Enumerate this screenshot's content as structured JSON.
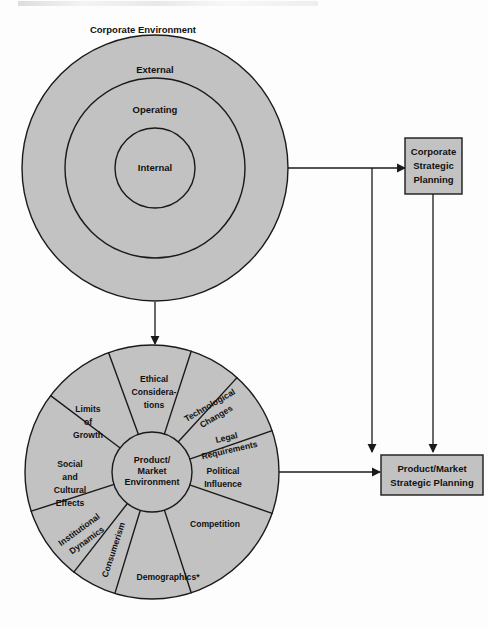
{
  "figure": {
    "title_top": "Corporate Environment",
    "footnote_marker": "*"
  },
  "corporate_environment": {
    "rings": [
      {
        "id": "external",
        "label": "External"
      },
      {
        "id": "operating",
        "label": "Operating"
      },
      {
        "id": "internal",
        "label": "Internal"
      }
    ]
  },
  "product_market_wheel": {
    "hub": {
      "line1": "Product/",
      "line2": "Market",
      "line3": "Environment"
    },
    "segments": [
      {
        "id": "ethical-considerations",
        "lines": [
          "Ethical",
          "Considera-",
          "tions"
        ]
      },
      {
        "id": "technological-changes",
        "lines": [
          "Technological",
          "Changes"
        ]
      },
      {
        "id": "legal-requirements",
        "lines": [
          "Legal",
          "Requirements"
        ]
      },
      {
        "id": "political-influence",
        "lines": [
          "Political",
          "Influence"
        ]
      },
      {
        "id": "competition",
        "lines": [
          "Competition"
        ]
      },
      {
        "id": "demographics",
        "lines": [
          "Demographics*"
        ]
      },
      {
        "id": "consumerism",
        "lines": [
          "Consumerism"
        ]
      },
      {
        "id": "institutional-dynamics",
        "lines": [
          "Institutional",
          "Dynamics"
        ]
      },
      {
        "id": "social-cultural-effects",
        "lines": [
          "Social",
          "and",
          "Cultural",
          "Effects"
        ]
      },
      {
        "id": "limits-of-growth",
        "lines": [
          "Limits",
          "of",
          "Growth"
        ]
      }
    ]
  },
  "boxes": {
    "corporate_strategic_planning": {
      "lines": [
        "Corporate",
        "Strategic",
        "Planning"
      ]
    },
    "product_market_strategic_planning": {
      "lines": [
        "Product/Market",
        "Strategic Planning"
      ]
    }
  },
  "colors": {
    "fill_gray": "#c2c2c2",
    "box_gray": "#c2c2c2",
    "stroke": "#1a1a1a",
    "text": "#111111",
    "page": "#fdfdfd"
  }
}
